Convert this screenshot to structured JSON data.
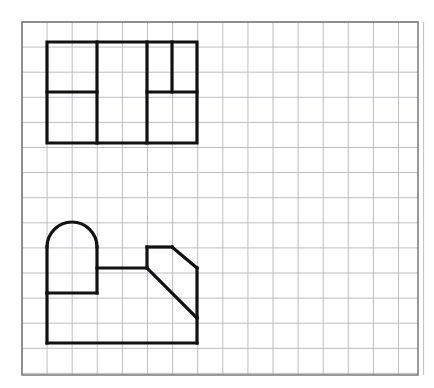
{
  "document": {
    "title": "Orthographic Projection Worksheet",
    "description": "Engineering drawing on graph paper showing a top view and a front view of a machine part"
  },
  "canvas": {
    "width": 434,
    "height": 388,
    "background_color": "#ffffff"
  },
  "grid": {
    "label": "graph-paper-grid",
    "origin_x": 22,
    "origin_y": 22,
    "right": 418,
    "bottom": 375,
    "cell_size": 25.1,
    "columns": 15,
    "rows": 14,
    "line_color": "#b6b6be",
    "line_width": 0.9,
    "border_color": "#6e6e76",
    "border_width": 1.4
  },
  "style": {
    "object_line_color": "#111111",
    "object_line_width": 3.2,
    "line_join": "miter",
    "line_cap": "square"
  },
  "figures": [
    {
      "name": "top-view",
      "label": "Top view (plan) rectangle with internal partitions",
      "bounds": {
        "x1": 47,
        "y1": 42,
        "x2": 197,
        "y2": 143
      },
      "outline": [
        [
          47,
          42
        ],
        [
          197,
          42
        ],
        [
          197,
          143
        ],
        [
          47,
          143
        ],
        [
          47,
          42
        ]
      ],
      "internal_lines": [
        {
          "name": "vertical-divider-1",
          "points": [
            [
              97,
              42
            ],
            [
              97,
              143
            ]
          ]
        },
        {
          "name": "vertical-divider-2",
          "points": [
            [
              147,
              42
            ],
            [
              147,
              143
            ]
          ]
        },
        {
          "name": "vertical-divider-3-short",
          "points": [
            [
              172,
              42
            ],
            [
              172,
              92
            ]
          ]
        },
        {
          "name": "horizontal-divider-left",
          "points": [
            [
              47,
              92
            ],
            [
              97,
              92
            ]
          ]
        },
        {
          "name": "horizontal-divider-right",
          "points": [
            [
              147,
              92
            ],
            [
              197,
              92
            ]
          ]
        }
      ]
    },
    {
      "name": "front-view",
      "label": "Front view profile with rounded arch, step and chamfered slant",
      "bounds": {
        "x1": 47,
        "y1": 222,
        "x2": 197,
        "y2": 343
      },
      "outline_segments": [
        {
          "type": "line",
          "name": "arch-left-wall",
          "points": [
            [
              47,
              247
            ],
            [
              47,
              293
            ]
          ]
        },
        {
          "type": "line",
          "name": "step-ledge-lower",
          "points": [
            [
              47,
              293
            ],
            [
              47,
              343
            ]
          ]
        },
        {
          "type": "line",
          "name": "base-bottom-edge",
          "points": [
            [
              47,
              343
            ],
            [
              197,
              343
            ]
          ]
        },
        {
          "type": "line",
          "name": "base-right-wall",
          "points": [
            [
              197,
              343
            ],
            [
              197,
              318
            ]
          ]
        },
        {
          "type": "line",
          "name": "chamfer-slant-lower",
          "points": [
            [
              197,
              318
            ],
            [
              147,
              268
            ]
          ]
        },
        {
          "type": "line",
          "name": "boss-left-wall",
          "points": [
            [
              147,
              268
            ],
            [
              147,
              247
            ]
          ]
        },
        {
          "type": "line",
          "name": "boss-top-edge",
          "points": [
            [
              147,
              247
            ],
            [
              172,
              247
            ]
          ]
        },
        {
          "type": "line",
          "name": "chamfer-slant-upper",
          "points": [
            [
              172,
              247
            ],
            [
              197,
              268
            ]
          ]
        },
        {
          "type": "line",
          "name": "chamfer-right-wall",
          "points": [
            [
              197,
              268
            ],
            [
              197,
              318
            ]
          ]
        },
        {
          "type": "line",
          "name": "deck-top-edge",
          "points": [
            [
              97,
              268
            ],
            [
              147,
              268
            ]
          ]
        },
        {
          "type": "line",
          "name": "arch-body-right-wall",
          "points": [
            [
              97,
              247
            ],
            [
              97,
              293
            ]
          ]
        },
        {
          "type": "line",
          "name": "step-ledge-upper",
          "points": [
            [
              47,
              293
            ],
            [
              97,
              293
            ]
          ]
        },
        {
          "type": "arc",
          "name": "arch-dome",
          "cx": 72,
          "cy": 247,
          "rx": 25,
          "ry": 25,
          "start_deg": 180,
          "end_deg": 360
        }
      ]
    }
  ]
}
